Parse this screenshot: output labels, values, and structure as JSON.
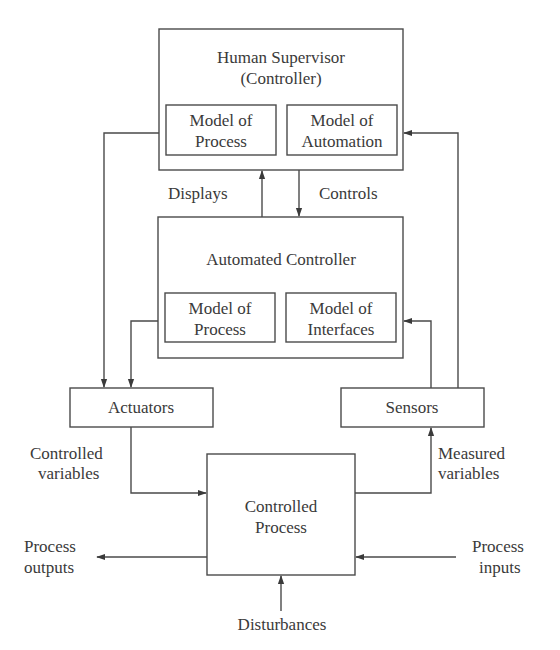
{
  "diagram": {
    "human_supervisor": {
      "title_line1": "Human Supervisor",
      "title_line2": "(Controller)",
      "model_process": {
        "line1": "Model of",
        "line2": "Process"
      },
      "model_automation": {
        "line1": "Model of",
        "line2": "Automation"
      }
    },
    "automated_controller": {
      "title": "Automated Controller",
      "model_process": {
        "line1": "Model of",
        "line2": "Process"
      },
      "model_interfaces": {
        "line1": "Model of",
        "line2": "Interfaces"
      }
    },
    "labels": {
      "displays": "Displays",
      "controls": "Controls",
      "controlled_variables_1": "Controlled",
      "controlled_variables_2": "variables",
      "measured_variables_1": "Measured",
      "measured_variables_2": "variables",
      "process_outputs_1": "Process",
      "process_outputs_2": "outputs",
      "process_inputs_1": "Process",
      "process_inputs_2": "inputs",
      "disturbances": "Disturbances"
    },
    "actuators": {
      "label": "Actuators"
    },
    "sensors": {
      "label": "Sensors"
    },
    "controlled_process": {
      "line1": "Controlled",
      "line2": "Process"
    }
  }
}
